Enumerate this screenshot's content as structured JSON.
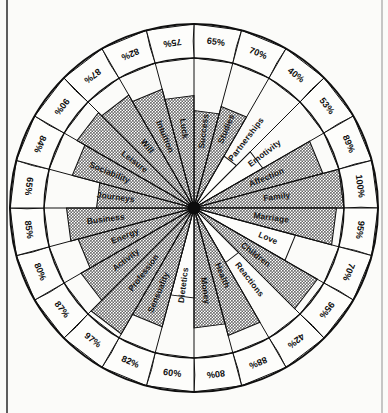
{
  "page": {
    "background_color": "#fbfbf9",
    "ink_color": "#111111",
    "fill_color": "#8d8d8d"
  },
  "chart_data": {
    "type": "pie",
    "variant": "radial-percentage-wheel",
    "title": "",
    "subtitle": "",
    "xlabel": "",
    "ylabel": "",
    "grid": false,
    "legend_position": "none",
    "value_unit": "%",
    "value_range": [
      0,
      100
    ],
    "sector_count": 24,
    "start_angle_deg": -90,
    "direction": "clockwise",
    "categories": [
      "Success",
      "Studies",
      "Partnerships",
      "Emotivity",
      "Affection",
      "Family",
      "Marriage",
      "Love",
      "Children",
      "Reactions",
      "Health",
      "Money",
      "Dietetics",
      "Sensuality",
      "Profession",
      "Activity",
      "Energy",
      "Business",
      "Journeys",
      "Sociability",
      "Leisure",
      "Will",
      "Intuition",
      "Luck"
    ],
    "values": [
      65,
      70,
      40,
      53,
      89,
      100,
      95,
      70,
      95,
      42,
      88,
      80,
      60,
      82,
      97,
      87,
      80,
      85,
      65,
      84,
      90,
      87,
      82,
      75
    ],
    "labels": [
      "65%",
      "70%",
      "40%",
      "53%",
      "89%",
      "100%",
      "95%",
      "70%",
      "95%",
      "42%",
      "88%",
      "80%",
      "60%",
      "82%",
      "97%",
      "87%",
      "80%",
      "85%",
      "65%",
      "84%",
      "90%",
      "87%",
      "82%",
      "75%"
    ],
    "sectors": [
      {
        "label": "Success",
        "value": 65,
        "display": "65%",
        "filled": true
      },
      {
        "label": "Studies",
        "value": 70,
        "display": "70%",
        "filled": true
      },
      {
        "label": "Partnerships",
        "value": 40,
        "display": "40%",
        "filled": false
      },
      {
        "label": "Emotivity",
        "value": 53,
        "display": "53%",
        "filled": false
      },
      {
        "label": "Affection",
        "value": 89,
        "display": "89%",
        "filled": true
      },
      {
        "label": "Family",
        "value": 100,
        "display": "100%",
        "filled": true
      },
      {
        "label": "Marriage",
        "value": 95,
        "display": "95%",
        "filled": true
      },
      {
        "label": "Love",
        "value": 70,
        "display": "70%",
        "filled": false
      },
      {
        "label": "Children",
        "value": 95,
        "display": "95%",
        "filled": true
      },
      {
        "label": "Reactions",
        "value": 42,
        "display": "42%",
        "filled": false
      },
      {
        "label": "Health",
        "value": 88,
        "display": "88%",
        "filled": true
      },
      {
        "label": "Money",
        "value": 80,
        "display": "80%",
        "filled": true
      },
      {
        "label": "Dietetics",
        "value": 60,
        "display": "60%",
        "filled": false
      },
      {
        "label": "Sensuality",
        "value": 82,
        "display": "82%",
        "filled": true
      },
      {
        "label": "Profession",
        "value": 97,
        "display": "97%",
        "filled": true
      },
      {
        "label": "Activity",
        "value": 87,
        "display": "87%",
        "filled": true
      },
      {
        "label": "Energy",
        "value": 80,
        "display": "80%",
        "filled": true
      },
      {
        "label": "Business",
        "value": 85,
        "display": "85%",
        "filled": true
      },
      {
        "label": "Journeys",
        "value": 65,
        "display": "65%",
        "filled": true
      },
      {
        "label": "Sociability",
        "value": 84,
        "display": "84%",
        "filled": true
      },
      {
        "label": "Leisure",
        "value": 90,
        "display": "90%",
        "filled": true
      },
      {
        "label": "Will",
        "value": 87,
        "display": "87%",
        "filled": true
      },
      {
        "label": "Intuition",
        "value": 82,
        "display": "82%",
        "filled": true
      },
      {
        "label": "Luck",
        "value": 75,
        "display": "75%",
        "filled": true
      }
    ]
  }
}
